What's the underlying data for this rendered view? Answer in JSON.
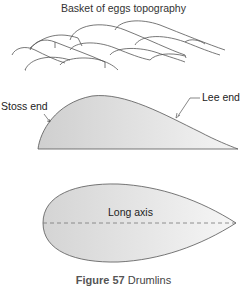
{
  "figure": {
    "number_label": "Figure 57",
    "title": "Drumlins"
  },
  "panels": {
    "topography": {
      "title": "Basket of eggs topography"
    },
    "profile": {
      "stoss_label": "Stoss end",
      "lee_label": "Lee end"
    },
    "plan": {
      "axis_label": "Long axis"
    }
  },
  "colors": {
    "fill": "#d9d9d9",
    "stroke": "#555555",
    "axis_dash": "#777777"
  }
}
